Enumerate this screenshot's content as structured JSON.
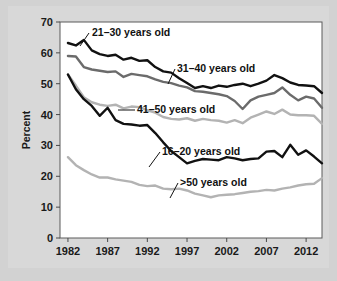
{
  "figure": {
    "background_color": "#d2d2d2",
    "plot_background_color": "#ffffff",
    "frame_color": "#5a5a5a"
  },
  "chart_data": {
    "type": "line",
    "title": "",
    "xlabel": "",
    "ylabel": "Percent",
    "xlim": [
      1981,
      2014
    ],
    "ylim": [
      0,
      70
    ],
    "ytick_labels": [
      "0",
      "10",
      "20",
      "30",
      "40",
      "50",
      "60",
      "70"
    ],
    "ytick_values": [
      0,
      10,
      20,
      30,
      40,
      50,
      60,
      70
    ],
    "xtick_labels": [
      "1982",
      "1987",
      "1992",
      "1997",
      "2002",
      "2007",
      "2012"
    ],
    "xtick_values": [
      1982,
      1987,
      1992,
      1997,
      2002,
      2007,
      2012
    ],
    "grid": false,
    "legend_position": "inline-callouts",
    "x": [
      1982,
      1983,
      1984,
      1985,
      1986,
      1987,
      1988,
      1989,
      1990,
      1991,
      1992,
      1993,
      1994,
      1995,
      1996,
      1997,
      1998,
      1999,
      2000,
      2001,
      2002,
      2003,
      2004,
      2005,
      2006,
      2007,
      2008,
      2009,
      2010,
      2011,
      2012,
      2013,
      2014
    ],
    "series": [
      {
        "name": "21–30 years old",
        "color": "#111111",
        "line_width": 2.4,
        "values": [
          63.2,
          62.4,
          64.2,
          60.8,
          59.6,
          59.0,
          59.4,
          57.8,
          58.4,
          57.4,
          57.6,
          55.4,
          54.0,
          53.6,
          51.8,
          50.2,
          48.6,
          49.2,
          48.6,
          49.4,
          49.0,
          49.6,
          50.0,
          49.2,
          50.0,
          51.0,
          52.8,
          51.8,
          50.4,
          49.6,
          49.4,
          49.2,
          47.0
        ]
      },
      {
        "name": "31–40 years old",
        "color": "#6b6b6b",
        "line_width": 2.4,
        "values": [
          59.0,
          58.8,
          55.4,
          54.6,
          54.2,
          53.8,
          54.0,
          52.2,
          53.2,
          52.8,
          52.4,
          51.4,
          50.6,
          50.2,
          49.4,
          48.8,
          47.6,
          47.4,
          47.0,
          46.6,
          46.0,
          44.4,
          41.8,
          44.6,
          45.8,
          46.4,
          47.0,
          48.8,
          46.4,
          44.6,
          45.8,
          45.2,
          42.2
        ]
      },
      {
        "name": "41–50 years old",
        "color": "#b3b3b3",
        "line_width": 2.4,
        "values": [
          53.0,
          49.4,
          45.6,
          44.0,
          43.2,
          42.8,
          43.2,
          42.0,
          42.6,
          42.4,
          41.4,
          40.6,
          39.2,
          38.6,
          38.4,
          38.8,
          38.0,
          38.6,
          38.2,
          38.0,
          37.4,
          38.2,
          37.2,
          39.0,
          40.0,
          41.0,
          40.2,
          41.6,
          40.0,
          39.8,
          39.8,
          39.6,
          37.0
        ]
      },
      {
        "name": "16–20 years old",
        "color": "#111111",
        "line_width": 2.4,
        "values": [
          53.0,
          48.2,
          45.0,
          42.8,
          39.6,
          42.2,
          38.2,
          37.0,
          36.8,
          36.4,
          36.6,
          34.0,
          31.0,
          28.2,
          26.2,
          24.2,
          25.0,
          25.6,
          25.4,
          25.2,
          26.2,
          25.8,
          25.2,
          25.6,
          25.8,
          28.0,
          28.2,
          26.2,
          30.2,
          27.0,
          28.4,
          26.4,
          24.2
        ]
      },
      {
        "name": ">50 years old",
        "color": "#b3b3b3",
        "line_width": 2.4,
        "values": [
          26.2,
          23.6,
          22.0,
          20.6,
          19.6,
          19.6,
          19.0,
          18.6,
          18.2,
          17.2,
          16.8,
          17.0,
          16.0,
          15.8,
          16.0,
          15.4,
          14.4,
          13.8,
          13.2,
          13.8,
          14.0,
          14.2,
          14.6,
          15.0,
          15.2,
          15.6,
          15.4,
          16.0,
          16.4,
          17.0,
          17.4,
          17.6,
          19.4
        ]
      }
    ],
    "annotations": [
      {
        "label": "21–30 years old",
        "text_x": 92,
        "text_y": 36,
        "leader": [
          [
            89,
            33
          ],
          [
            80,
            46
          ]
        ]
      },
      {
        "label": "31–40 years old",
        "text_x": 177,
        "text_y": 72,
        "leader": [
          [
            175,
            69
          ],
          [
            168,
            84
          ]
        ]
      },
      {
        "label": "41–50 years old",
        "text_x": 137,
        "text_y": 113,
        "leader": [
          [
            135,
            110
          ],
          [
            118,
            110
          ]
        ]
      },
      {
        "label": "16–20 years old",
        "text_x": 162,
        "text_y": 155,
        "leader": [
          [
            160,
            152
          ],
          [
            149,
            167
          ]
        ]
      },
      {
        "label": ">50 years old",
        "text_x": 180,
        "text_y": 186,
        "leader": [
          [
            178,
            183
          ],
          [
            170,
            198
          ]
        ]
      }
    ]
  }
}
